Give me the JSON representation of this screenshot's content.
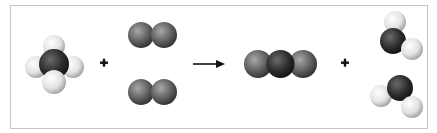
{
  "diagram": {
    "equation": "CH4 + 2 O2 -> CO2 + 2 H2O",
    "reactants": [
      {
        "name": "methane",
        "formula": "CH4",
        "count": 1
      },
      {
        "name": "oxygen",
        "formula": "O2",
        "count": 2
      }
    ],
    "products": [
      {
        "name": "carbon dioxide",
        "formula": "CO2",
        "count": 1
      },
      {
        "name": "water",
        "formula": "H2O",
        "count": 2
      }
    ],
    "operators": {
      "plus_1": "+",
      "arrow": "→",
      "plus_2": "+"
    },
    "colors": {
      "hydrogen": "#e8e8e8",
      "carbon": "#2e2e2e",
      "oxygen": "#6a6a6a",
      "border": "#c4c4c4",
      "arrow": "#111111"
    }
  }
}
